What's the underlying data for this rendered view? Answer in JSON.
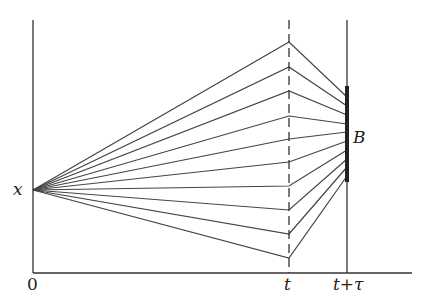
{
  "diagram": {
    "labels": {
      "origin": "0",
      "start_point": "x",
      "time_t": "t",
      "time_t_tau": "t+τ",
      "target_set": "B"
    },
    "colors": {
      "line": "#444444",
      "axis": "#333333",
      "bar": "#222222"
    },
    "geometry": {
      "origin_x": 33,
      "axis_top": 20,
      "axis_y": 273,
      "axis_right": 412,
      "start_y": 190,
      "t_x": 289,
      "t_tau_x": 347,
      "b_top": 86,
      "b_bottom": 182
    },
    "paths": [
      {
        "mid_y": 42,
        "end_y": 97
      },
      {
        "mid_y": 67,
        "end_y": 106
      },
      {
        "mid_y": 91,
        "end_y": 115
      },
      {
        "mid_y": 116,
        "end_y": 124
      },
      {
        "mid_y": 139,
        "end_y": 132
      },
      {
        "mid_y": 162,
        "end_y": 141
      },
      {
        "mid_y": 186,
        "end_y": 150
      },
      {
        "mid_y": 210,
        "end_y": 159
      },
      {
        "mid_y": 234,
        "end_y": 167
      },
      {
        "mid_y": 258,
        "end_y": 176
      }
    ]
  }
}
